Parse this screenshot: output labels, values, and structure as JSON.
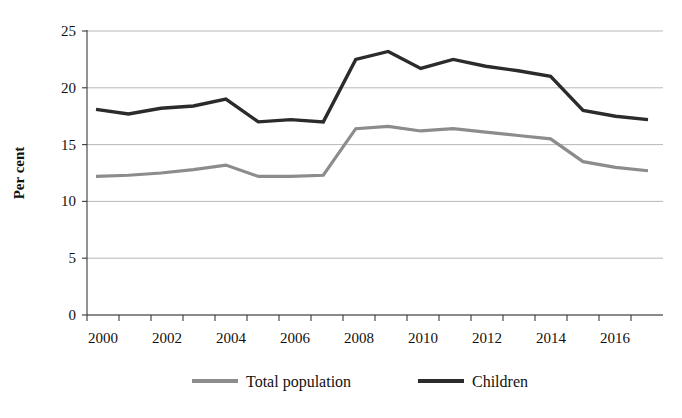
{
  "chart_data": {
    "type": "line",
    "title": "",
    "xlabel": "",
    "ylabel": "Per cent",
    "x": [
      2000,
      2001,
      2002,
      2003,
      2004,
      2005,
      2006,
      2007,
      2008,
      2009,
      2010,
      2011,
      2012,
      2013,
      2014,
      2015,
      2016,
      2017
    ],
    "xtick_labels": [
      "2000",
      "2002",
      "2004",
      "2006",
      "2008",
      "2010",
      "2012",
      "2014",
      "2016"
    ],
    "xtick_values": [
      2000,
      2002,
      2004,
      2006,
      2008,
      2010,
      2012,
      2014,
      2016
    ],
    "ytick_labels": [
      "0",
      "5",
      "10",
      "15",
      "20",
      "25"
    ],
    "ytick_values": [
      0,
      5,
      10,
      15,
      20,
      25
    ],
    "ylim": [
      0,
      25
    ],
    "xlim": [
      2000,
      2017
    ],
    "grid": "horizontal",
    "legend_position": "bottom",
    "series": [
      {
        "name": "Total population",
        "color": "#8c8c8c",
        "stroke_width": 3.2,
        "values": [
          12.2,
          12.3,
          12.5,
          12.8,
          13.2,
          12.2,
          12.2,
          12.3,
          16.4,
          16.6,
          16.2,
          16.4,
          16.1,
          15.8,
          15.5,
          13.5,
          13.0,
          12.7
        ]
      },
      {
        "name": "Children",
        "color": "#2b2b2b",
        "stroke_width": 3.4,
        "values": [
          18.1,
          17.7,
          18.2,
          18.4,
          19.0,
          17.0,
          17.2,
          17.0,
          22.5,
          23.2,
          21.7,
          22.5,
          21.9,
          21.5,
          21.0,
          18.0,
          17.5,
          17.2
        ]
      }
    ]
  },
  "legend": {
    "items": [
      {
        "label": "Total population",
        "color": "#8c8c8c"
      },
      {
        "label": "Children",
        "color": "#2b2b2b"
      }
    ]
  },
  "axes": {
    "y_title": "Per cent"
  }
}
